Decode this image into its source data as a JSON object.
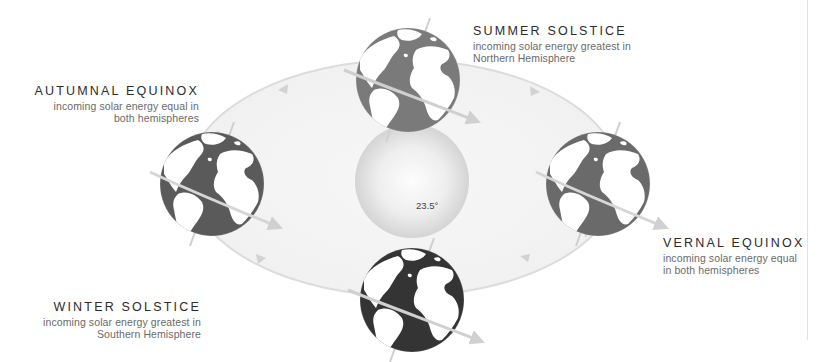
{
  "diagram": {
    "type": "seasons-orbit",
    "central_body": "sun",
    "tilt_label": "23.5°",
    "positions": [
      {
        "id": "summer",
        "title": "SUMMER SOLSTICE",
        "desc_line1": "incoming solar energy greatest in",
        "desc_line2": "Northern Hemisphere"
      },
      {
        "id": "autumn",
        "title": "AUTUMNAL EQUINOX",
        "desc_line1": "incoming solar energy equal in",
        "desc_line2": "both hemispheres"
      },
      {
        "id": "vernal",
        "title": "VERNAL EQUINOX",
        "desc_line1": "incoming solar energy equal",
        "desc_line2": "in both hemispheres"
      },
      {
        "id": "winter",
        "title": "WINTER SOLSTICE",
        "desc_line1": "incoming solar energy greatest in",
        "desc_line2": "Southern Hemisphere"
      }
    ],
    "colors": {
      "orbit_fill": "#f4f4f4",
      "orbit_line": "#dadada",
      "sun_center": "#fbfbfb",
      "sun_edge": "#d6d6d6",
      "land_light": "#ffffff",
      "ocean_dark": "#3c3c3c",
      "ocean_mid": "#666666",
      "ocean_light": "#808080",
      "axis_line": "#c8c8c8",
      "divider": "#e2e2e2"
    }
  }
}
